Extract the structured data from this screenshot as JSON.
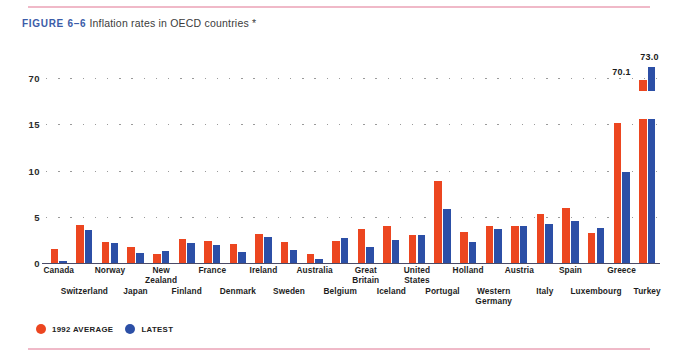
{
  "figure": {
    "number_label": "FIGURE 6–6",
    "caption": "Inflation rates in OECD countries *"
  },
  "legend": {
    "series_1_label": "1992 AVERAGE",
    "series_1_color": "#ec4620",
    "series_2_label": "LATEST",
    "series_2_color": "#2c4fa6"
  },
  "axis": {
    "y_ticks": [
      "70",
      "15",
      "10",
      "5",
      "0"
    ]
  },
  "annotations": {
    "turkey_1992": "70.1",
    "turkey_latest": "73.0"
  },
  "chart_data": {
    "type": "bar",
    "title": "Inflation rates in OECD countries *",
    "xlabel": "",
    "ylabel": "",
    "ylim": [
      0,
      16
    ],
    "grid": true,
    "legend_position": "bottom-left",
    "note": "Y axis is broken: ticks 0,5,10,15 then 70. Turkey bars are drawn as broken bars near the 70 gridline.",
    "categories": [
      "Canada",
      "Switzerland",
      "Norway",
      "Japan",
      "New Zealand",
      "Finland",
      "France",
      "Denmark",
      "Ireland",
      "Sweden",
      "Australia",
      "Belgium",
      "Great Britain",
      "Iceland",
      "United States",
      "Portugal",
      "Holland",
      "Western Germany",
      "Austria",
      "Italy",
      "Spain",
      "Luxembourg",
      "Greece",
      "Turkey"
    ],
    "series": [
      {
        "name": "1992 AVERAGE",
        "color": "#ec4620",
        "values": [
          1.5,
          4.1,
          2.3,
          1.7,
          1.0,
          2.6,
          2.4,
          2.1,
          3.1,
          2.3,
          1.0,
          2.4,
          3.7,
          4.0,
          3.0,
          8.9,
          3.4,
          4.0,
          4.0,
          5.3,
          5.9,
          3.2,
          15.1,
          70.1
        ]
      },
      {
        "name": "LATEST",
        "color": "#2c4fa6",
        "values": [
          0.2,
          3.6,
          2.2,
          1.1,
          1.3,
          2.2,
          2.0,
          1.2,
          2.8,
          1.4,
          0.4,
          2.7,
          1.7,
          2.5,
          3.0,
          5.8,
          2.3,
          3.7,
          4.0,
          4.2,
          4.6,
          3.8,
          9.8,
          73.0
        ]
      }
    ]
  }
}
